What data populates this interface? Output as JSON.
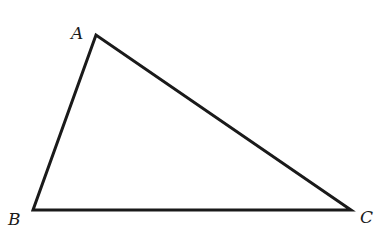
{
  "diagram": {
    "type": "triangle",
    "stroke_color": "#1a1a1a",
    "vertices": [
      {
        "label": "A",
        "x": 96,
        "y": 35,
        "label_x": 71,
        "label_y": 39
      },
      {
        "label": "B",
        "x": 33,
        "y": 210,
        "label_x": 8,
        "label_y": 225
      },
      {
        "label": "C",
        "x": 351,
        "y": 210,
        "label_x": 360,
        "label_y": 223
      }
    ]
  }
}
